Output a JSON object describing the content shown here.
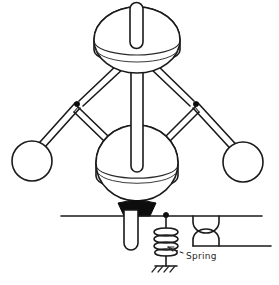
{
  "figure": {
    "type": "hand-drawn-mechanical-diagram",
    "background_color": "#ffffff",
    "ink_color": "#1a1a1a"
  },
  "annotations": [
    {
      "id": "spring-label",
      "text": "Spring",
      "x": 186,
      "y": 259,
      "leader_from": [
        183,
        253
      ],
      "leader_to": [
        166,
        246
      ],
      "arrow": true
    }
  ],
  "parts": {
    "top_cap": {
      "name": "shaft-top-cap",
      "cx": 136,
      "cy": 9,
      "rx": 6.5,
      "ry": 6.5
    },
    "upper_disc": {
      "name": "upper-disc",
      "cx": 137,
      "cy": 40,
      "rx": 43,
      "ry": 33,
      "side_depth": 10
    },
    "lower_disc": {
      "name": "lower-sleeve-disc",
      "cx": 137,
      "cy": 163,
      "rx": 41,
      "ry": 38,
      "side_depth": 12
    },
    "drive_shaft": {
      "name": "vertical-drive-shaft",
      "x": 137,
      "top_y": 9,
      "bottom_y": 172,
      "half_width": 6
    },
    "left_ball": {
      "name": "left-flyball",
      "cx": 32,
      "cy": 161,
      "r": 20
    },
    "right_ball": {
      "name": "right-flyball",
      "cx": 243,
      "cy": 162,
      "r": 20
    },
    "left_pivot": {
      "name": "left-pivot-joint",
      "cx": 77,
      "cy": 104,
      "r": 2.6
    },
    "right_pivot": {
      "name": "right-pivot-joint",
      "cx": 196,
      "cy": 104,
      "r": 2.6
    },
    "cone_sleeve": {
      "name": "sleeve-collar-black",
      "cx": 137,
      "top_y": 202,
      "bottom_y": 216,
      "top_half_width": 19,
      "bottom_half_width": 13
    },
    "lower_rod": {
      "name": "lower-output-rod",
      "x": 131,
      "top_y": 214,
      "bottom_y": 250,
      "half_width": 7
    },
    "lever": {
      "name": "horizontal-lever-line",
      "x1": 61,
      "x2": 262,
      "y": 216
    },
    "lever_pivot": {
      "name": "lever-pivot-dot",
      "cx": 166,
      "cy": 215,
      "r": 2.4
    },
    "spring": {
      "name": "coil-spring",
      "cx": 166,
      "top_y": 216,
      "bottom_y": 262,
      "coil_count": 6,
      "coil_rx": 11,
      "coil_ry": 4.4
    },
    "ground": {
      "name": "ground-hatch-symbol",
      "cx": 166,
      "y": 266,
      "width": 22,
      "hatch_count": 4
    },
    "valve": {
      "name": "hourglass-valve-symbol",
      "cx": 206,
      "top_y": 216,
      "bottom_y": 246,
      "half_width": 13
    },
    "pipe_right": {
      "name": "pipe-outlet-line",
      "x1": 219,
      "x2": 271,
      "y": 246
    }
  },
  "geometry": {
    "upper_arm_left": {
      "x1": 117,
      "y1": 66,
      "x2": 77,
      "y2": 104,
      "width": 6
    },
    "upper_arm_right": {
      "x1": 157,
      "y1": 66,
      "x2": 196,
      "y2": 104,
      "width": 6
    },
    "lower_arm_left": {
      "x1": 77,
      "y1": 104,
      "x2": 32,
      "y2": 161,
      "width": 6
    },
    "lower_arm_right": {
      "x1": 196,
      "y1": 104,
      "x2": 243,
      "y2": 162,
      "width": 6
    },
    "link_left": {
      "x1": 77,
      "y1": 108,
      "x2": 106,
      "y2": 140,
      "width": 5
    },
    "link_right": {
      "x1": 196,
      "y1": 108,
      "x2": 168,
      "y2": 140,
      "width": 5
    }
  }
}
